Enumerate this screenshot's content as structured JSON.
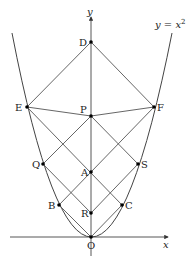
{
  "diagram": {
    "curve_label": "y = x²",
    "curve_label_parts": {
      "lhs": "y",
      "eq": " = ",
      "rhs": "x",
      "exp": "2"
    },
    "axes": {
      "x_label": "x",
      "y_label": "y"
    },
    "points": {
      "D": {
        "label": "D",
        "x": 91,
        "y": 42
      },
      "E": {
        "label": "E",
        "x": 27,
        "y": 107
      },
      "F": {
        "label": "F",
        "x": 154,
        "y": 107
      },
      "P": {
        "label": "P",
        "x": 91,
        "y": 116
      },
      "Q": {
        "label": "Q",
        "x": 43,
        "y": 164
      },
      "S": {
        "label": "S",
        "x": 138,
        "y": 164
      },
      "A": {
        "label": "A",
        "x": 91,
        "y": 172
      },
      "B": {
        "label": "B",
        "x": 59,
        "y": 205
      },
      "C": {
        "label": "C",
        "x": 122,
        "y": 205
      },
      "R": {
        "label": "R",
        "x": 91,
        "y": 213
      },
      "O": {
        "label": "O",
        "x": 91,
        "y": 237
      }
    },
    "segments": [
      [
        "D",
        "E"
      ],
      [
        "D",
        "F"
      ],
      [
        "E",
        "P"
      ],
      [
        "P",
        "F"
      ],
      [
        "E",
        "C"
      ],
      [
        "F",
        "B"
      ],
      [
        "P",
        "Q"
      ],
      [
        "P",
        "S"
      ],
      [
        "Q",
        "R"
      ],
      [
        "S",
        "R"
      ],
      [
        "B",
        "O"
      ],
      [
        "C",
        "O"
      ]
    ]
  }
}
